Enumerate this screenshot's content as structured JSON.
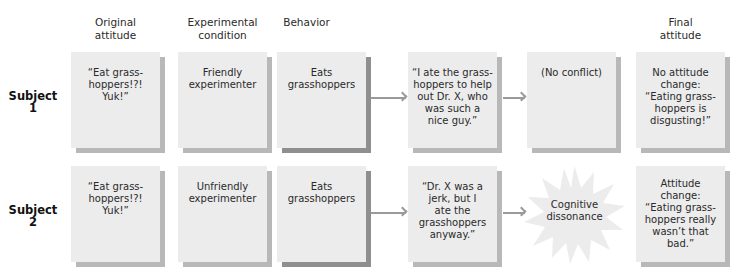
{
  "column_headers": [
    {
      "label": "Original\nattitude"
    },
    {
      "label": "Experimental\ncondition"
    },
    {
      "label": "Behavior"
    },
    {
      "label": ""
    },
    {
      "label": ""
    },
    {
      "label": "Final\nattitude"
    }
  ],
  "rows": [
    {
      "subject_label": "Subject\n1",
      "original_attitude": "“Eat grass-\nhoppers!?!\nYuk!”",
      "experimental_condition": "Friendly\nexperimenter",
      "behavior": "Eats\ngrasshoppers",
      "justification": "“I ate the grass-\nhoppers to help\nout Dr. X, who\nwas such a\nnice guy.”",
      "conflict": "(No conflict)",
      "final_attitude": "No attitude\nchange:\n“Eating grass-\nhoppers is\ndisgusting!”"
    },
    {
      "subject_label": "Subject\n2",
      "original_attitude": "“Eat grass-\nhoppers!?!\nYuk!”",
      "experimental_condition": "Unfriendly\nexperimenter",
      "behavior": "Eats\ngrasshoppers",
      "justification": "“Dr. X was a\njerk, but I\nate the\ngrasshoppers\nanyway.”",
      "conflict": "Cognitive\ndissonance",
      "final_attitude": "Attitude\nchange:\n“Eating grass-\nhoppers really\nwasn’t that\nbad.”"
    }
  ],
  "colors": {
    "box_fill": "#ececec",
    "box_shadow": "#b8b8b8",
    "box_shadow_dark": "#8f8f8f",
    "arrow": "#9a9a9a",
    "text": "#2a2a2a"
  }
}
